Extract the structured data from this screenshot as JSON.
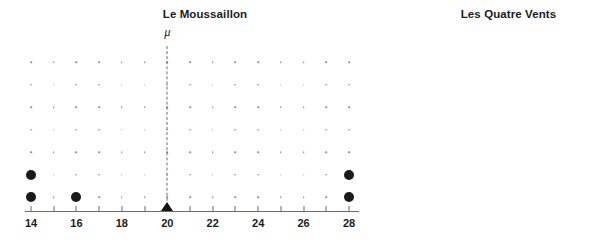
{
  "figure": {
    "width": 607,
    "height": 252,
    "background": "#ffffff",
    "dot_color": "#1a1a1a",
    "grid_dot_color": "#8a8a8a",
    "axis_color": "#6b6b6b",
    "mu_line_color": "#6e6e6e"
  },
  "chart_data": [
    {
      "type": "scatter",
      "id": "le-moussaillon",
      "title": "Le Moussaillon",
      "xlabel": "",
      "ylabel": "",
      "xlim": [
        14,
        28
      ],
      "grid": true,
      "legend": null,
      "annotations": [
        {
          "text": "μ",
          "x": 20,
          "kind": "mean-line",
          "marker": "triangle"
        }
      ],
      "mean": 20,
      "grid_columns": [
        14,
        15,
        16,
        17,
        18,
        19,
        20,
        21,
        22,
        23,
        24,
        25,
        26,
        27,
        28
      ],
      "grid_rows": 7,
      "tick_values": [
        14,
        15,
        16,
        17,
        18,
        19,
        20,
        21,
        22,
        23,
        24,
        25,
        26,
        27,
        28
      ],
      "tick_labels": [
        {
          "value": 14,
          "label": "14"
        },
        {
          "value": 16,
          "label": "16"
        },
        {
          "value": 18,
          "label": "18"
        },
        {
          "value": 20,
          "label": "20"
        },
        {
          "value": 22,
          "label": "22"
        },
        {
          "value": 24,
          "label": "24"
        },
        {
          "value": 26,
          "label": "26"
        },
        {
          "value": 28,
          "label": "28"
        }
      ],
      "categories": [
        14,
        15,
        16,
        17,
        18,
        19,
        20,
        21,
        22,
        23,
        24,
        25,
        26,
        27,
        28
      ],
      "values": [
        2,
        0,
        1,
        0,
        0,
        0,
        0,
        0,
        0,
        0,
        0,
        0,
        0,
        0,
        2
      ],
      "points": [
        {
          "x": 14,
          "stack": 1
        },
        {
          "x": 14,
          "stack": 2
        },
        {
          "x": 16,
          "stack": 1
        },
        {
          "x": 28,
          "stack": 1
        },
        {
          "x": 28,
          "stack": 2
        }
      ]
    },
    {
      "type": "scatter",
      "id": "les-quatre-vents",
      "title": "Les Quatre Vents",
      "xlabel": "",
      "ylabel": "",
      "xlim": [
        22,
        27
      ],
      "grid": true,
      "legend": null,
      "annotations": [
        {
          "text": "μ",
          "x": 24,
          "kind": "mean-line",
          "marker": "triangle"
        }
      ],
      "mean": 24,
      "grid_columns": [
        22,
        23,
        24,
        25,
        26,
        27
      ],
      "grid_rows": 7,
      "tick_values": [
        22,
        23,
        24,
        25,
        26,
        27
      ],
      "tick_labels": [
        {
          "value": 22,
          "label": "22"
        },
        {
          "value": 24,
          "label": "24"
        },
        {
          "value": 26,
          "label": "26"
        }
      ],
      "categories": [
        22,
        23,
        24,
        25,
        26,
        27
      ],
      "values": [
        1,
        1,
        2,
        1,
        1,
        0
      ],
      "points": [
        {
          "x": 22,
          "stack": 1
        },
        {
          "x": 23,
          "stack": 1
        },
        {
          "x": 24,
          "stack": 1
        },
        {
          "x": 24,
          "stack": 2
        },
        {
          "x": 25,
          "stack": 1
        },
        {
          "x": 26,
          "stack": 1
        }
      ]
    }
  ]
}
